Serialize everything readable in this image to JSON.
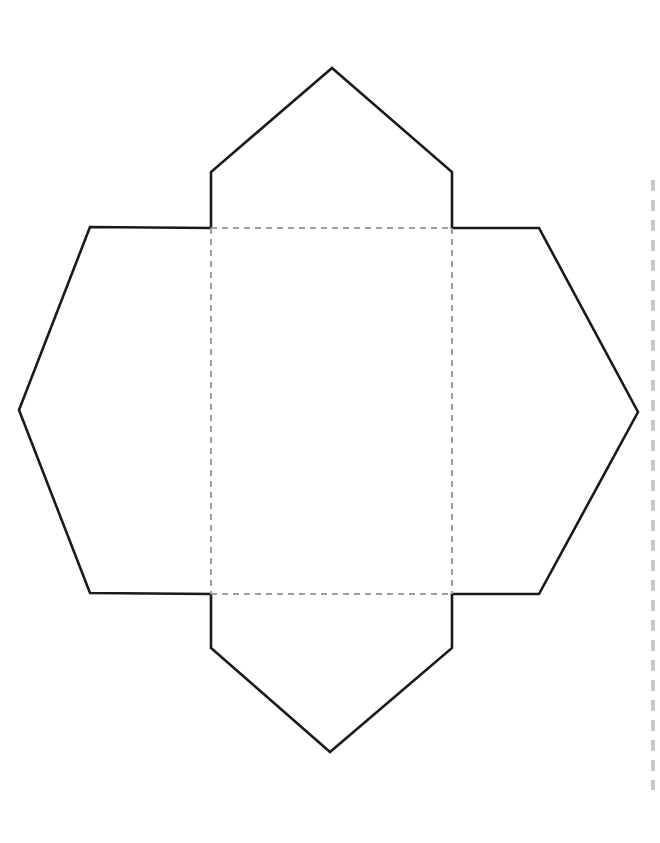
{
  "document": {
    "title": "Envelope Papercraft Template",
    "kind": "cut-and-fold-template",
    "canvas": {
      "width": 660,
      "height": 843
    },
    "background_color": "#ffffff"
  },
  "colors": {
    "cut_line": "#1a1a1a",
    "fold_line": "#9e9e9e",
    "perforation_line": "#c9c9c9",
    "paper": "#ffffff"
  },
  "line_styles": {
    "cut": {
      "label": "cut line",
      "dash": "solid",
      "width": 2.6
    },
    "fold": {
      "label": "fold line",
      "dash": "dashed",
      "width": 2.1,
      "dasharray": "6 5"
    },
    "perforation": {
      "label": "page edge perforation",
      "dash": "dashed",
      "width": 4,
      "dasharray": "11 9"
    }
  },
  "geometry": {
    "outline_path": "M 332 68 L 452 172 L 452 228 L 539 228 L 638 412 L 539 594 L 452 594 L 452 648 L 330 752 L 211 648 L 211 594 L 90 593 L 19 410 L 90 227 L 211 228 L 211 172 Z",
    "fold_lines": [
      {
        "name": "fold-top",
        "d": "M 211 228 L 452 228"
      },
      {
        "name": "fold-bottom",
        "d": "M 211 594 L 452 594"
      },
      {
        "name": "fold-left",
        "d": "M 211 228 L 211 594"
      },
      {
        "name": "fold-right",
        "d": "M 452 228 L 452 594"
      }
    ],
    "perforation": {
      "name": "perforation-right-edge",
      "d": "M 653 180 L 653 790"
    },
    "center_panel": {
      "x": 211,
      "y": 228,
      "width": 241,
      "height": 366
    },
    "flaps": [
      {
        "name": "top-flap",
        "d": "M 211 228 L 211 172 L 332 68 L 452 172 L 452 228 Z",
        "apex": {
          "x": 332,
          "y": 68
        }
      },
      {
        "name": "bottom-flap",
        "d": "M 211 594 L 211 648 L 330 752 L 452 648 L 452 594 Z",
        "apex": {
          "x": 330,
          "y": 752
        }
      },
      {
        "name": "left-flap",
        "d": "M 211 228 L 90 227 L 19 410 L 90 593 L 211 594 Z",
        "apex": {
          "x": 19,
          "y": 410
        }
      },
      {
        "name": "right-flap",
        "d": "M 452 228 L 539 228 L 638 412 L 539 594 L 452 594 Z",
        "apex": {
          "x": 638,
          "y": 412
        }
      }
    ]
  }
}
